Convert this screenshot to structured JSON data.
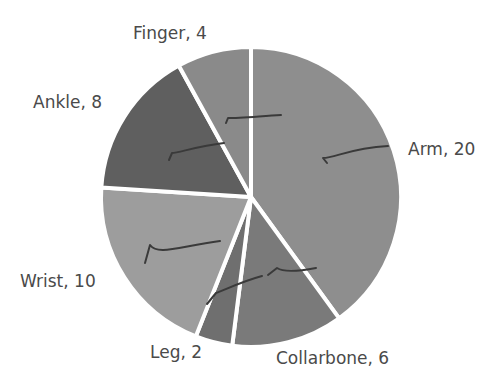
{
  "chart_data": {
    "type": "pie",
    "title": "",
    "categories": [
      "Arm",
      "Collarbone",
      "Leg",
      "Wrist",
      "Ankle",
      "Finger"
    ],
    "values": [
      20,
      6,
      2,
      10,
      8,
      4
    ],
    "labels": [
      "Arm, 20",
      "Collarbone, 6",
      "Leg, 2",
      "Wrist, 10",
      "Ankle, 8",
      "Finger, 4"
    ],
    "colors": [
      "#8e8e8e",
      "#7a7a7a",
      "#6f6f6f",
      "#9d9d9d",
      "#5f5f5f",
      "#8a8a8a"
    ],
    "start_angle_deg": 0,
    "direction": "clockwise",
    "legend": "none (data labels outside slices)",
    "annotations": "handwritten check marks on each slice"
  }
}
